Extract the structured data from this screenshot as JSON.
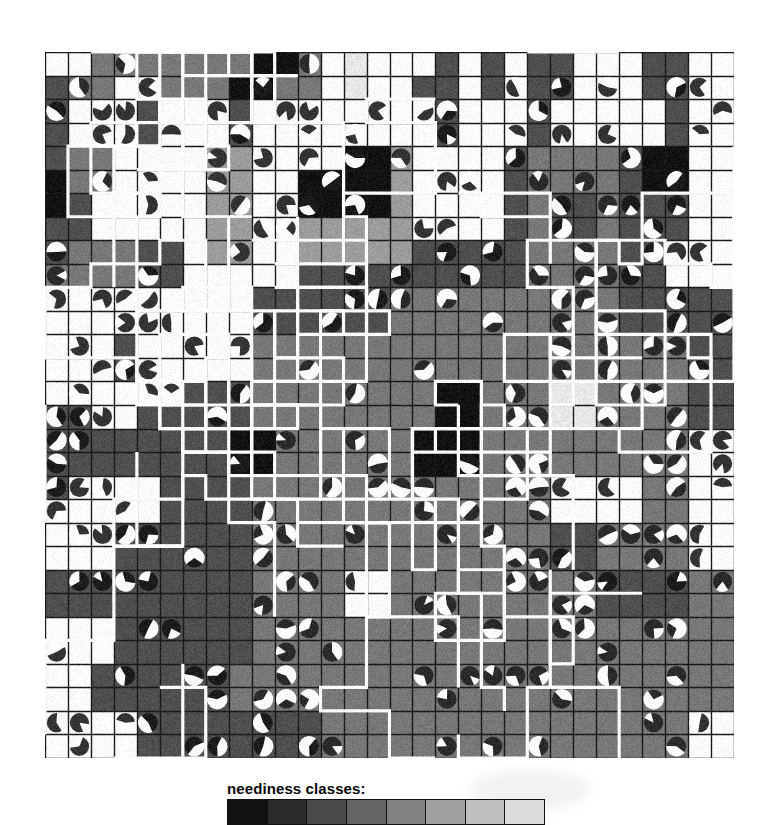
{
  "figure": {
    "kind": "grid-choropleth-map"
  },
  "map": {
    "columns": 30,
    "rows": 30,
    "cell_px": 22.96,
    "grid_line_color": "#1a1a1a",
    "boundary_line_color": "#ffffff",
    "background_color": "#fdfdfd"
  },
  "legend": {
    "title": "neediness classes:",
    "swatch_count": 8,
    "swatch_colors": [
      "#111111",
      "#2b2b2b",
      "#4a4a4a",
      "#646464",
      "#828282",
      "#a0a0a0",
      "#bfbfbf",
      "#dcdcdc"
    ],
    "border_color": "#111111"
  },
  "palette": {
    "class_0_white": "#fdfdfd",
    "class_1_verylight": "#e8e8e8",
    "class_2_light": "#c9c9c9",
    "class_3_medium": "#9c9c9c",
    "class_4_mediumdark": "#787878",
    "class_5_dark": "#4f4f4f",
    "class_6_verydark": "#2e2e2e",
    "class_7_black": "#121212"
  },
  "chart_data": {
    "type": "heatmap",
    "title": "neediness classes",
    "xlabel": "",
    "ylabel": "",
    "grid": true,
    "legend_position": "bottom",
    "categories": [
      "class 0",
      "class 1",
      "class 2",
      "class 3",
      "class 4",
      "class 5",
      "class 6",
      "class 7"
    ],
    "class_values": [
      0,
      1,
      2,
      3,
      4,
      5,
      6,
      7
    ],
    "nx": 30,
    "ny": 30,
    "note": "Cell values are neediness class indices 0 (lightest) to 7 (darkest); pie glyphs mark sampled locations and encode an additional share as a white wedge angle.",
    "cells": [
      [
        0,
        0,
        4,
        4,
        4,
        4,
        4,
        4,
        4,
        7,
        7,
        4,
        0,
        1,
        0,
        0,
        0,
        5,
        0,
        5,
        0,
        5,
        5,
        0,
        0,
        0,
        5,
        5,
        0,
        0
      ],
      [
        5,
        4,
        4,
        0,
        0,
        4,
        4,
        4,
        7,
        7,
        4,
        4,
        0,
        1,
        0,
        0,
        5,
        5,
        0,
        5,
        0,
        5,
        5,
        0,
        0,
        0,
        5,
        5,
        0,
        0
      ],
      [
        5,
        0,
        0,
        0,
        5,
        0,
        0,
        0,
        5,
        0,
        0,
        0,
        0,
        0,
        0,
        0,
        0,
        5,
        0,
        0,
        0,
        5,
        0,
        0,
        0,
        0,
        0,
        5,
        0,
        0
      ],
      [
        5,
        0,
        0,
        0,
        5,
        0,
        0,
        0,
        5,
        0,
        0,
        0,
        0,
        0,
        0,
        0,
        0,
        5,
        0,
        0,
        0,
        5,
        0,
        0,
        0,
        0,
        0,
        5,
        0,
        0
      ],
      [
        5,
        4,
        4,
        0,
        0,
        0,
        0,
        3,
        3,
        0,
        0,
        0,
        0,
        7,
        7,
        3,
        0,
        0,
        0,
        0,
        5,
        4,
        4,
        4,
        4,
        5,
        7,
        7,
        0,
        0
      ],
      [
        7,
        4,
        4,
        0,
        0,
        0,
        0,
        3,
        3,
        0,
        0,
        7,
        7,
        7,
        7,
        3,
        0,
        0,
        0,
        0,
        5,
        4,
        4,
        4,
        4,
        5,
        7,
        7,
        0,
        0
      ],
      [
        7,
        5,
        0,
        0,
        0,
        0,
        0,
        3,
        3,
        0,
        0,
        7,
        7,
        7,
        7,
        3,
        0,
        0,
        0,
        0,
        5,
        4,
        5,
        5,
        4,
        5,
        5,
        5,
        0,
        0
      ],
      [
        5,
        5,
        0,
        0,
        0,
        0,
        0,
        3,
        3,
        0,
        0,
        3,
        3,
        3,
        3,
        3,
        0,
        0,
        0,
        0,
        5,
        4,
        5,
        5,
        4,
        5,
        5,
        5,
        0,
        0
      ],
      [
        5,
        4,
        4,
        4,
        5,
        5,
        0,
        3,
        3,
        0,
        0,
        3,
        3,
        3,
        3,
        3,
        5,
        5,
        5,
        5,
        5,
        4,
        4,
        4,
        4,
        5,
        5,
        0,
        0,
        0
      ],
      [
        4,
        4,
        4,
        4,
        5,
        5,
        0,
        0,
        0,
        0,
        0,
        5,
        5,
        5,
        5,
        5,
        5,
        5,
        5,
        5,
        5,
        4,
        4,
        4,
        4,
        5,
        5,
        0,
        0,
        0
      ],
      [
        0,
        0,
        0,
        0,
        0,
        0,
        0,
        0,
        0,
        5,
        5,
        5,
        5,
        5,
        5,
        4,
        4,
        4,
        4,
        4,
        4,
        4,
        4,
        4,
        4,
        5,
        5,
        5,
        5,
        5
      ],
      [
        0,
        0,
        0,
        0,
        0,
        0,
        0,
        0,
        0,
        5,
        5,
        5,
        5,
        5,
        5,
        4,
        4,
        4,
        4,
        4,
        4,
        4,
        4,
        4,
        4,
        5,
        5,
        5,
        5,
        5
      ],
      [
        0,
        0,
        0,
        5,
        0,
        0,
        0,
        0,
        0,
        4,
        4,
        4,
        4,
        4,
        4,
        4,
        4,
        4,
        4,
        4,
        4,
        4,
        4,
        4,
        4,
        4,
        4,
        4,
        5,
        5
      ],
      [
        0,
        0,
        0,
        5,
        0,
        0,
        0,
        0,
        0,
        4,
        4,
        4,
        4,
        4,
        4,
        4,
        4,
        4,
        4,
        4,
        4,
        4,
        4,
        4,
        4,
        4,
        4,
        4,
        5,
        5
      ],
      [
        0,
        0,
        0,
        0,
        0,
        0,
        5,
        5,
        5,
        4,
        4,
        4,
        4,
        4,
        4,
        4,
        4,
        7,
        7,
        4,
        4,
        4,
        1,
        1,
        4,
        4,
        4,
        4,
        5,
        5
      ],
      [
        5,
        5,
        0,
        0,
        5,
        5,
        5,
        5,
        5,
        4,
        4,
        4,
        4,
        4,
        4,
        4,
        4,
        7,
        7,
        4,
        4,
        4,
        1,
        1,
        4,
        4,
        4,
        4,
        5,
        5
      ],
      [
        5,
        5,
        5,
        5,
        5,
        5,
        5,
        5,
        7,
        7,
        4,
        4,
        4,
        4,
        4,
        4,
        7,
        7,
        7,
        4,
        4,
        4,
        4,
        4,
        4,
        4,
        4,
        4,
        0,
        0
      ],
      [
        5,
        5,
        5,
        5,
        5,
        5,
        5,
        5,
        7,
        7,
        4,
        4,
        4,
        4,
        4,
        4,
        7,
        7,
        7,
        4,
        4,
        4,
        4,
        4,
        4,
        4,
        4,
        4,
        0,
        0
      ],
      [
        5,
        0,
        0,
        0,
        0,
        5,
        5,
        5,
        5,
        4,
        4,
        4,
        4,
        4,
        4,
        4,
        4,
        4,
        4,
        4,
        4,
        4,
        0,
        0,
        0,
        0,
        4,
        4,
        0,
        0
      ],
      [
        0,
        0,
        0,
        0,
        0,
        5,
        5,
        5,
        5,
        4,
        4,
        4,
        4,
        4,
        4,
        4,
        4,
        4,
        4,
        4,
        4,
        4,
        0,
        0,
        0,
        0,
        4,
        4,
        0,
        0
      ],
      [
        0,
        0,
        0,
        5,
        5,
        5,
        5,
        5,
        5,
        4,
        4,
        4,
        4,
        4,
        4,
        4,
        4,
        4,
        4,
        4,
        4,
        4,
        5,
        5,
        4,
        4,
        4,
        4,
        0,
        0
      ],
      [
        0,
        0,
        0,
        5,
        5,
        5,
        5,
        5,
        5,
        4,
        4,
        4,
        4,
        4,
        4,
        4,
        4,
        4,
        4,
        4,
        4,
        4,
        5,
        5,
        4,
        4,
        4,
        4,
        0,
        0
      ],
      [
        5,
        5,
        5,
        5,
        5,
        5,
        5,
        5,
        5,
        4,
        4,
        4,
        4,
        0,
        0,
        4,
        4,
        4,
        4,
        4,
        4,
        4,
        4,
        4,
        5,
        5,
        5,
        5,
        4,
        4
      ],
      [
        5,
        5,
        5,
        5,
        5,
        5,
        5,
        5,
        5,
        4,
        4,
        4,
        4,
        0,
        0,
        4,
        4,
        4,
        4,
        4,
        4,
        4,
        4,
        4,
        5,
        5,
        5,
        5,
        4,
        4
      ],
      [
        0,
        0,
        0,
        5,
        5,
        5,
        5,
        5,
        5,
        4,
        4,
        4,
        4,
        4,
        4,
        4,
        4,
        4,
        4,
        4,
        4,
        4,
        4,
        4,
        4,
        4,
        4,
        4,
        4,
        4
      ],
      [
        0,
        0,
        0,
        5,
        5,
        5,
        5,
        5,
        5,
        4,
        4,
        4,
        4,
        4,
        4,
        4,
        4,
        4,
        4,
        4,
        4,
        4,
        4,
        4,
        4,
        4,
        4,
        4,
        4,
        4
      ],
      [
        0,
        0,
        5,
        5,
        5,
        5,
        5,
        5,
        4,
        4,
        4,
        4,
        4,
        4,
        4,
        4,
        4,
        4,
        4,
        4,
        4,
        4,
        4,
        4,
        4,
        4,
        4,
        4,
        4,
        4
      ],
      [
        0,
        0,
        5,
        5,
        5,
        5,
        5,
        5,
        4,
        4,
        4,
        4,
        4,
        4,
        4,
        4,
        4,
        4,
        4,
        4,
        4,
        4,
        4,
        4,
        4,
        4,
        4,
        4,
        4,
        4
      ],
      [
        0,
        0,
        0,
        0,
        5,
        5,
        5,
        5,
        5,
        5,
        5,
        5,
        4,
        4,
        4,
        4,
        4,
        4,
        4,
        4,
        4,
        4,
        4,
        4,
        4,
        4,
        4,
        4,
        0,
        0
      ],
      [
        0,
        0,
        0,
        0,
        5,
        5,
        5,
        5,
        5,
        5,
        5,
        5,
        4,
        4,
        4,
        4,
        4,
        4,
        4,
        4,
        4,
        4,
        4,
        4,
        4,
        4,
        4,
        4,
        0,
        0
      ]
    ],
    "pie_glyphs_note": "Pie glyphs are drawn on selected cells; each has a start angle and a white wedge sweep in degrees."
  }
}
